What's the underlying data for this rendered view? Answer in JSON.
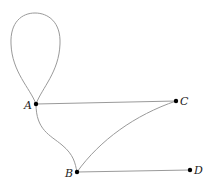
{
  "diagram": {
    "type": "graph",
    "nodes": [
      {
        "id": "A",
        "label": "A",
        "x": 36,
        "y": 104
      },
      {
        "id": "B",
        "label": "B",
        "x": 77,
        "y": 172
      },
      {
        "id": "C",
        "label": "C",
        "x": 176,
        "y": 101
      },
      {
        "id": "D",
        "label": "D",
        "x": 190,
        "y": 170
      }
    ],
    "edges": [
      {
        "from": "A",
        "to": "A",
        "kind": "loop"
      },
      {
        "from": "A",
        "to": "C",
        "kind": "straight"
      },
      {
        "from": "A",
        "to": "B",
        "kind": "curve"
      },
      {
        "from": "B",
        "to": "C",
        "kind": "curve"
      },
      {
        "from": "B",
        "to": "D",
        "kind": "straight"
      }
    ],
    "colors": {
      "edge": "#9a9a9a",
      "node": "#000000"
    }
  }
}
